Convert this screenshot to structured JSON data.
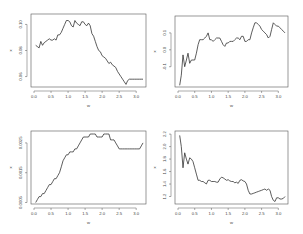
{
  "chart_data": [
    {
      "type": "line",
      "panel": "top-left",
      "xlabel": "w",
      "ylabel": "x",
      "xticks": [
        "0.0",
        "0.5",
        "1.0",
        "1.5",
        "2.0",
        "2.5",
        "3.0"
      ],
      "yticks": [
        "0.10",
        "0.08",
        "0.06"
      ],
      "xlim": [
        0.0,
        3.2
      ],
      "ylim": [
        0.052,
        0.108
      ],
      "x": [
        0.05,
        0.1,
        0.15,
        0.2,
        0.25,
        0.3,
        0.35,
        0.4,
        0.45,
        0.5,
        0.55,
        0.6,
        0.65,
        0.7,
        0.75,
        0.8,
        0.85,
        0.9,
        0.95,
        1.0,
        1.05,
        1.1,
        1.15,
        1.2,
        1.25,
        1.3,
        1.35,
        1.4,
        1.45,
        1.5,
        1.55,
        1.6,
        1.65,
        1.7,
        1.75,
        1.8,
        1.85,
        1.9,
        1.95,
        2.0,
        2.05,
        2.1,
        2.15,
        2.2,
        2.25,
        2.3,
        2.35,
        2.4,
        2.45,
        2.5,
        2.55,
        2.6,
        2.65,
        2.7,
        2.75,
        2.8,
        2.85,
        2.9,
        2.95,
        3.0,
        3.05,
        3.1,
        3.15,
        3.2
      ],
      "y": [
        0.084,
        0.083,
        0.082,
        0.087,
        0.084,
        0.086,
        0.087,
        0.088,
        0.089,
        0.088,
        0.088,
        0.089,
        0.088,
        0.092,
        0.092,
        0.094,
        0.097,
        0.1,
        0.103,
        0.103,
        0.102,
        0.099,
        0.098,
        0.103,
        0.101,
        0.1,
        0.099,
        0.102,
        0.102,
        0.1,
        0.099,
        0.101,
        0.099,
        0.093,
        0.091,
        0.087,
        0.083,
        0.08,
        0.079,
        0.076,
        0.075,
        0.074,
        0.072,
        0.07,
        0.071,
        0.069,
        0.068,
        0.067,
        0.064,
        0.062,
        0.06,
        0.058,
        0.056,
        0.054,
        0.057,
        0.058,
        0.058,
        0.058,
        0.058,
        0.058,
        0.058,
        0.058,
        0.058,
        0.058
      ]
    },
    {
      "type": "line",
      "panel": "top-right",
      "xlabel": "w",
      "ylabel": "x",
      "xticks": [
        "0.0",
        "0.5",
        "1.0",
        "1.5",
        "2.0",
        "2.5",
        "3.0"
      ],
      "yticks": [
        "0.1",
        "0.0",
        "-0.1"
      ],
      "xlim": [
        0.0,
        3.2
      ],
      "ylim": [
        -0.22,
        0.2
      ],
      "x": [
        0.05,
        0.1,
        0.15,
        0.2,
        0.25,
        0.3,
        0.35,
        0.4,
        0.45,
        0.5,
        0.55,
        0.6,
        0.65,
        0.7,
        0.75,
        0.8,
        0.85,
        0.9,
        0.95,
        1.0,
        1.05,
        1.1,
        1.15,
        1.2,
        1.25,
        1.3,
        1.35,
        1.4,
        1.45,
        1.5,
        1.55,
        1.6,
        1.65,
        1.7,
        1.75,
        1.8,
        1.85,
        1.9,
        1.95,
        2.0,
        2.05,
        2.1,
        2.15,
        2.2,
        2.25,
        2.3,
        2.35,
        2.4,
        2.45,
        2.5,
        2.55,
        2.6,
        2.65,
        2.7,
        2.75,
        2.8,
        2.85,
        2.9,
        2.95,
        3.0,
        3.05,
        3.1,
        3.15,
        3.2
      ],
      "y": [
        -0.21,
        -0.15,
        -0.03,
        -0.1,
        -0.06,
        -0.02,
        -0.08,
        -0.06,
        -0.06,
        -0.06,
        -0.02,
        0.03,
        0.06,
        0.06,
        0.06,
        0.07,
        0.08,
        0.1,
        0.06,
        0.06,
        0.05,
        0.06,
        0.07,
        0.07,
        0.07,
        0.05,
        0.03,
        0.02,
        0.04,
        0.04,
        0.05,
        0.05,
        0.05,
        0.06,
        0.07,
        0.07,
        0.06,
        0.08,
        0.08,
        0.05,
        0.05,
        0.06,
        0.06,
        0.1,
        0.13,
        0.16,
        0.16,
        0.15,
        0.14,
        0.12,
        0.11,
        0.1,
        0.09,
        0.07,
        0.08,
        0.12,
        0.16,
        0.15,
        0.14,
        0.14,
        0.13,
        0.12,
        0.11,
        0.1
      ]
    },
    {
      "type": "line",
      "panel": "bottom-left",
      "xlabel": "w",
      "ylabel": "x",
      "xticks": [
        "0.0",
        "0.5",
        "1.0",
        "1.5",
        "2.0",
        "2.5",
        "3.0"
      ],
      "yticks": [
        "0.0025",
        "0.0015",
        "0.0005"
      ],
      "xlim": [
        0.0,
        3.2
      ],
      "ylim": [
        0.00045,
        0.0029
      ],
      "x": [
        0.05,
        0.1,
        0.15,
        0.2,
        0.25,
        0.3,
        0.35,
        0.4,
        0.45,
        0.5,
        0.55,
        0.6,
        0.65,
        0.7,
        0.75,
        0.8,
        0.85,
        0.9,
        0.95,
        1.0,
        1.05,
        1.1,
        1.15,
        1.2,
        1.25,
        1.3,
        1.35,
        1.4,
        1.45,
        1.5,
        1.55,
        1.6,
        1.65,
        1.7,
        1.75,
        1.8,
        1.85,
        1.9,
        1.95,
        2.0,
        2.05,
        2.1,
        2.15,
        2.2,
        2.25,
        2.3,
        2.35,
        2.4,
        2.45,
        2.5,
        2.55,
        2.6,
        2.65,
        2.7,
        2.75,
        2.8,
        2.85,
        2.9,
        2.95,
        3.0,
        3.05,
        3.1,
        3.15,
        3.2
      ],
      "y": [
        0.0005,
        0.0006,
        0.0007,
        0.0007,
        0.0008,
        0.0008,
        0.0009,
        0.001,
        0.0011,
        0.0011,
        0.0012,
        0.0013,
        0.0013,
        0.0014,
        0.0015,
        0.0017,
        0.0019,
        0.002,
        0.0021,
        0.0021,
        0.0022,
        0.0022,
        0.0022,
        0.0023,
        0.0023,
        0.0024,
        0.0025,
        0.0026,
        0.0027,
        0.0027,
        0.0027,
        0.0027,
        0.0028,
        0.0028,
        0.0028,
        0.0028,
        0.0027,
        0.0027,
        0.0027,
        0.0027,
        0.0028,
        0.0028,
        0.0028,
        0.0028,
        0.0026,
        0.0026,
        0.0026,
        0.0025,
        0.0024,
        0.0023,
        0.0023,
        0.0023,
        0.0023,
        0.0023,
        0.0023,
        0.0023,
        0.0023,
        0.0023,
        0.0023,
        0.0023,
        0.0023,
        0.0023,
        0.0024,
        0.0025
      ]
    },
    {
      "type": "line",
      "panel": "bottom-right",
      "xlabel": "w",
      "ylabel": "x",
      "xticks": [
        "0.0",
        "0.5",
        "1.0",
        "1.5",
        "2.0",
        "2.5",
        "3.0"
      ],
      "yticks": [
        "2.2",
        "2.0",
        "1.8",
        "1.6",
        "1.4",
        "1.2"
      ],
      "xlim": [
        0.0,
        3.2
      ],
      "ylim": [
        1.08,
        2.25
      ],
      "x": [
        0.05,
        0.1,
        0.15,
        0.2,
        0.25,
        0.3,
        0.35,
        0.4,
        0.45,
        0.5,
        0.55,
        0.6,
        0.65,
        0.7,
        0.75,
        0.8,
        0.85,
        0.9,
        0.95,
        1.0,
        1.05,
        1.1,
        1.15,
        1.2,
        1.25,
        1.3,
        1.35,
        1.4,
        1.45,
        1.5,
        1.55,
        1.6,
        1.65,
        1.7,
        1.75,
        1.8,
        1.85,
        1.9,
        1.95,
        2.0,
        2.05,
        2.1,
        2.15,
        2.2,
        2.25,
        2.3,
        2.35,
        2.4,
        2.45,
        2.5,
        2.55,
        2.6,
        2.65,
        2.7,
        2.75,
        2.8,
        2.85,
        2.9,
        2.95,
        3.0,
        3.05,
        3.1,
        3.15,
        3.2
      ],
      "y": [
        2.18,
        2.0,
        1.66,
        1.9,
        1.8,
        1.72,
        1.82,
        1.8,
        1.76,
        1.66,
        1.56,
        1.46,
        1.46,
        1.44,
        1.44,
        1.42,
        1.4,
        1.46,
        1.46,
        1.44,
        1.44,
        1.44,
        1.43,
        1.43,
        1.48,
        1.51,
        1.5,
        1.48,
        1.46,
        1.47,
        1.45,
        1.44,
        1.44,
        1.42,
        1.43,
        1.41,
        1.46,
        1.47,
        1.45,
        1.44,
        1.4,
        1.3,
        1.24,
        1.24,
        1.25,
        1.26,
        1.27,
        1.28,
        1.29,
        1.3,
        1.31,
        1.32,
        1.3,
        1.32,
        1.3,
        1.2,
        1.14,
        1.12,
        1.18,
        1.18,
        1.16,
        1.16,
        1.17,
        1.2
      ]
    }
  ]
}
